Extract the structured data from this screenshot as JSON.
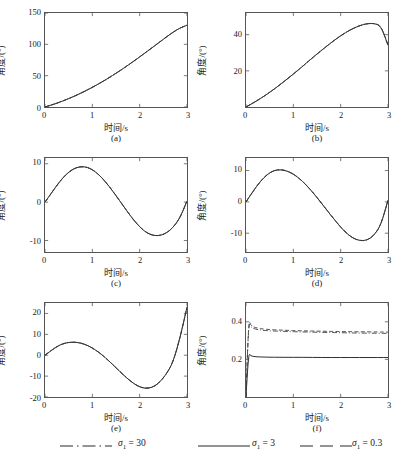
{
  "figure": {
    "axis_label_y": "角度/(°)",
    "axis_label_x": "时间/s",
    "captions": [
      "(a)",
      "(b)",
      "(c)",
      "(d)",
      "(e)",
      "(f)"
    ]
  },
  "legend": {
    "items": [
      {
        "label": "σ₁ = 30",
        "sigma": "σ",
        "subscript": "1",
        "equals": "= 30",
        "style": "dashdot"
      },
      {
        "label": "σ₁ = 3",
        "sigma": "σ",
        "subscript": "1",
        "equals": "= 3",
        "style": "solid"
      },
      {
        "label": "σ₁ = 0.3",
        "sigma": "σ",
        "subscript": "1",
        "equals": "= 0.3",
        "style": "dashed"
      }
    ]
  },
  "chart_data": [
    {
      "type": "line",
      "panel": "(a)",
      "title": "",
      "xlabel": "时间/s",
      "ylabel": "角度/(°)",
      "xlim": [
        0,
        3
      ],
      "ylim": [
        0,
        150
      ],
      "xticks": [
        0,
        1,
        2,
        3
      ],
      "yticks": [
        0,
        50,
        100,
        150
      ],
      "grid": false,
      "legend_position": "below-figure",
      "x": [
        0,
        0.15,
        0.3,
        0.45,
        0.6,
        0.75,
        0.9,
        1.05,
        1.2,
        1.35,
        1.5,
        1.65,
        1.8,
        1.95,
        2.1,
        2.25,
        2.4,
        2.55,
        2.7,
        2.85,
        3
      ],
      "series": [
        {
          "name": "σ₁ = 30",
          "style": "dashdot",
          "values": [
            0,
            3.5,
            7.4,
            11.8,
            16.6,
            21.8,
            27.4,
            33.4,
            39.8,
            46.6,
            53.8,
            61.3,
            69.1,
            77.2,
            85.5,
            93.9,
            102.4,
            110.9,
            119.2,
            126.0,
            130.5
          ]
        },
        {
          "name": "σ₁ = 3",
          "style": "solid",
          "values": [
            0,
            3.5,
            7.4,
            11.8,
            16.6,
            21.8,
            27.4,
            33.4,
            39.8,
            46.6,
            53.8,
            61.3,
            69.1,
            77.2,
            85.5,
            93.9,
            102.4,
            110.9,
            119.2,
            126.0,
            130.5
          ]
        },
        {
          "name": "σ₁ = 0.3",
          "style": "dashed",
          "values": [
            0,
            3.5,
            7.4,
            11.8,
            16.6,
            21.8,
            27.4,
            33.4,
            39.8,
            46.6,
            53.8,
            61.3,
            69.1,
            77.2,
            85.5,
            93.9,
            102.4,
            110.9,
            119.2,
            126.0,
            130.5
          ]
        }
      ]
    },
    {
      "type": "line",
      "panel": "(b)",
      "xlabel": "时间/s",
      "ylabel": "角度/(°)",
      "xlim": [
        0,
        3
      ],
      "ylim": [
        0,
        52
      ],
      "xticks": [
        0,
        1,
        2,
        3
      ],
      "yticks": [
        20,
        40
      ],
      "grid": false,
      "x": [
        0,
        0.15,
        0.3,
        0.45,
        0.6,
        0.75,
        0.9,
        1.05,
        1.2,
        1.35,
        1.5,
        1.65,
        1.8,
        1.95,
        2.1,
        2.25,
        2.4,
        2.55,
        2.7,
        2.85,
        3
      ],
      "series": [
        {
          "name": "σ₁ = 30",
          "style": "dashdot",
          "values": [
            0,
            2.2,
            4.6,
            7.2,
            10.0,
            13.0,
            16.1,
            19.3,
            22.6,
            26.0,
            29.3,
            32.5,
            35.6,
            38.5,
            41.1,
            43.3,
            45.0,
            46.1,
            46.3,
            45.0,
            34.2
          ]
        },
        {
          "name": "σ₁ = 3",
          "style": "solid",
          "values": [
            0,
            2.2,
            4.6,
            7.2,
            10.0,
            13.0,
            16.1,
            19.3,
            22.6,
            26.0,
            29.3,
            32.5,
            35.6,
            38.5,
            41.1,
            43.3,
            45.0,
            46.1,
            46.3,
            45.0,
            34.2
          ]
        },
        {
          "name": "σ₁ = 0.3",
          "style": "dashed",
          "values": [
            0,
            2.2,
            4.6,
            7.2,
            10.0,
            13.0,
            16.1,
            19.3,
            22.6,
            26.0,
            29.3,
            32.5,
            35.6,
            38.5,
            41.1,
            43.3,
            45.0,
            46.1,
            46.3,
            45.0,
            34.2
          ]
        }
      ]
    },
    {
      "type": "line",
      "panel": "(c)",
      "xlabel": "时间/s",
      "ylabel": "角度/(°)",
      "xlim": [
        0,
        3
      ],
      "ylim": [
        -13,
        11.5
      ],
      "xticks": [
        0,
        1,
        2,
        3
      ],
      "yticks": [
        -10,
        0,
        10
      ],
      "grid": false,
      "x": [
        0,
        0.15,
        0.3,
        0.45,
        0.6,
        0.75,
        0.9,
        1.05,
        1.2,
        1.35,
        1.5,
        1.65,
        1.8,
        1.95,
        2.1,
        2.25,
        2.4,
        2.55,
        2.7,
        2.85,
        3
      ],
      "series": [
        {
          "name": "σ₁ = 30",
          "style": "dashdot",
          "values": [
            0,
            2.6,
            5.2,
            7.3,
            8.7,
            9.3,
            9.1,
            8.1,
            6.4,
            4.2,
            1.7,
            -0.9,
            -3.5,
            -5.8,
            -7.6,
            -8.6,
            -8.8,
            -8.2,
            -6.7,
            -4.2,
            0.3
          ]
        },
        {
          "name": "σ₁ = 3",
          "style": "solid",
          "values": [
            0,
            2.6,
            5.2,
            7.3,
            8.7,
            9.3,
            9.1,
            8.1,
            6.4,
            4.2,
            1.7,
            -0.9,
            -3.5,
            -5.8,
            -7.6,
            -8.6,
            -8.8,
            -8.2,
            -6.7,
            -4.2,
            0.3
          ]
        },
        {
          "name": "σ₁ = 0.3",
          "style": "dashed",
          "values": [
            0,
            2.6,
            5.2,
            7.3,
            8.7,
            9.3,
            9.1,
            8.1,
            6.4,
            4.2,
            1.7,
            -0.9,
            -3.5,
            -5.8,
            -7.6,
            -8.6,
            -8.8,
            -8.2,
            -6.7,
            -4.2,
            0.3
          ]
        }
      ]
    },
    {
      "type": "line",
      "panel": "(d)",
      "xlabel": "时间/s",
      "ylabel": "角度/(°)",
      "xlim": [
        0,
        3
      ],
      "ylim": [
        -16,
        14
      ],
      "xticks": [
        0,
        1,
        2,
        3
      ],
      "yticks": [
        -10,
        0,
        10
      ],
      "grid": false,
      "x": [
        0,
        0.15,
        0.3,
        0.45,
        0.6,
        0.75,
        0.9,
        1.05,
        1.2,
        1.35,
        1.5,
        1.65,
        1.8,
        1.95,
        2.1,
        2.25,
        2.4,
        2.55,
        2.7,
        2.85,
        3
      ],
      "series": [
        {
          "name": "σ₁ = 30",
          "style": "dashdot",
          "values": [
            0,
            3.4,
            6.5,
            8.8,
            10.1,
            10.3,
            9.7,
            8.4,
            6.5,
            4.1,
            1.4,
            -1.5,
            -4.4,
            -7.2,
            -9.7,
            -11.5,
            -12.4,
            -12.3,
            -10.8,
            -7.4,
            0.5
          ]
        },
        {
          "name": "σ₁ = 3",
          "style": "solid",
          "values": [
            0,
            3.4,
            6.5,
            8.8,
            10.1,
            10.3,
            9.7,
            8.4,
            6.5,
            4.1,
            1.4,
            -1.5,
            -4.4,
            -7.2,
            -9.7,
            -11.5,
            -12.4,
            -12.3,
            -10.8,
            -7.4,
            0.5
          ]
        },
        {
          "name": "σ₁ = 0.3",
          "style": "dashed",
          "values": [
            0,
            3.4,
            6.5,
            8.8,
            10.1,
            10.3,
            9.7,
            8.4,
            6.5,
            4.1,
            1.4,
            -1.5,
            -4.4,
            -7.2,
            -9.7,
            -11.5,
            -12.4,
            -12.3,
            -10.8,
            -7.4,
            0.5
          ]
        }
      ]
    },
    {
      "type": "line",
      "panel": "(e)",
      "xlabel": "时间/s",
      "ylabel": "角度/(°)",
      "xlim": [
        0,
        3
      ],
      "ylim": [
        -20,
        25
      ],
      "xticks": [
        0,
        1,
        2,
        3
      ],
      "yticks": [
        -20,
        -10,
        0,
        10,
        20
      ],
      "grid": false,
      "x": [
        0,
        0.15,
        0.3,
        0.45,
        0.6,
        0.75,
        0.9,
        1.05,
        1.2,
        1.35,
        1.5,
        1.65,
        1.8,
        1.95,
        2.1,
        2.25,
        2.4,
        2.55,
        2.7,
        2.85,
        3
      ],
      "series": [
        {
          "name": "σ₁ = 30",
          "style": "dashdot",
          "values": [
            0,
            2.6,
            4.8,
            6.0,
            6.3,
            5.9,
            4.7,
            2.8,
            0.3,
            -2.7,
            -6.0,
            -9.3,
            -12.3,
            -14.7,
            -15.9,
            -15.6,
            -13.5,
            -9.5,
            -3.7,
            8.0,
            23.0
          ]
        },
        {
          "name": "σ₁ = 3",
          "style": "solid",
          "values": [
            0,
            2.6,
            4.8,
            6.0,
            6.3,
            5.9,
            4.7,
            2.8,
            0.3,
            -2.7,
            -6.0,
            -9.3,
            -12.3,
            -14.7,
            -15.9,
            -15.6,
            -13.5,
            -9.5,
            -3.7,
            8.0,
            23.0
          ]
        },
        {
          "name": "σ₁ = 0.3",
          "style": "dashed",
          "values": [
            0,
            2.6,
            4.8,
            6.0,
            6.3,
            5.9,
            4.7,
            2.8,
            0.3,
            -2.7,
            -6.0,
            -9.3,
            -12.3,
            -14.7,
            -15.9,
            -15.6,
            -13.5,
            -9.5,
            -3.7,
            8.0,
            23.0
          ]
        }
      ]
    },
    {
      "type": "line",
      "panel": "(f)",
      "xlabel": "时间/s",
      "ylabel": "角度/(°)",
      "xlim": [
        0,
        3
      ],
      "ylim": [
        0,
        0.5
      ],
      "xticks": [
        0,
        1,
        2,
        3
      ],
      "yticks": [
        0.2,
        0.4
      ],
      "grid": false,
      "x": [
        0,
        0.05,
        0.1,
        0.2,
        0.4,
        0.8,
        1.2,
        1.6,
        2.0,
        2.4,
        2.8,
        3
      ],
      "series": [
        {
          "name": "σ₁ = 30",
          "style": "dashdot",
          "values": [
            0,
            0.4,
            0.372,
            0.36,
            0.353,
            0.349,
            0.346,
            0.344,
            0.342,
            0.34,
            0.339,
            0.338
          ]
        },
        {
          "name": "σ₁ = 3",
          "style": "solid",
          "values": [
            0,
            0.235,
            0.218,
            0.214,
            0.212,
            0.211,
            0.211,
            0.21,
            0.21,
            0.21,
            0.21,
            0.21
          ]
        },
        {
          "name": "σ₁ = 0.3",
          "style": "dashed",
          "values": [
            0,
            0.415,
            0.381,
            0.368,
            0.36,
            0.355,
            0.352,
            0.35,
            0.348,
            0.347,
            0.346,
            0.345
          ]
        }
      ]
    }
  ]
}
